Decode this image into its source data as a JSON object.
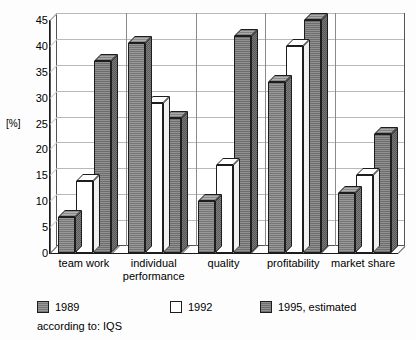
{
  "chart_data": {
    "type": "bar",
    "title": "",
    "subtitle": "",
    "xlabel": "",
    "ylabel": "[%]",
    "ylim": [
      0,
      45
    ],
    "yticks": [
      0,
      5,
      10,
      15,
      20,
      25,
      30,
      35,
      40,
      45
    ],
    "grid": true,
    "legend_position": "bottom",
    "style": "3d-grouped-columns",
    "categories": [
      "team work",
      "individual performance",
      "quality",
      "profitability",
      "market share"
    ],
    "series": [
      {
        "name": "1989",
        "color": "#8d8d8d",
        "values": [
          7,
          40.5,
          10,
          33,
          11.5
        ]
      },
      {
        "name": "1992",
        "color": "#ffffff",
        "values": [
          14,
          29,
          17,
          40,
          15
        ]
      },
      {
        "name": "1995, estimated",
        "color": "#868686",
        "values": [
          37,
          26,
          42,
          45,
          23
        ]
      }
    ],
    "annotations": [
      "according to: IQS"
    ]
  },
  "axis": {
    "y_label": "[%]",
    "tick_labels": [
      "45",
      "40",
      "35",
      "30",
      "25",
      "20",
      "15",
      "10",
      "5",
      "0"
    ]
  },
  "categories": [
    {
      "label_line1": "team work",
      "label_line2": ""
    },
    {
      "label_line1": "individual",
      "label_line2": "performance"
    },
    {
      "label_line1": "quality",
      "label_line2": ""
    },
    {
      "label_line1": "profitability",
      "label_line2": ""
    },
    {
      "label_line1": "market share",
      "label_line2": ""
    }
  ],
  "legend": {
    "items": [
      {
        "label": "1989",
        "color": "#8d8d8d"
      },
      {
        "label": "1992",
        "color": "#ffffff"
      },
      {
        "label": "1995, estimated",
        "color": "#868686"
      }
    ]
  },
  "source": {
    "note": "according to: IQS"
  }
}
